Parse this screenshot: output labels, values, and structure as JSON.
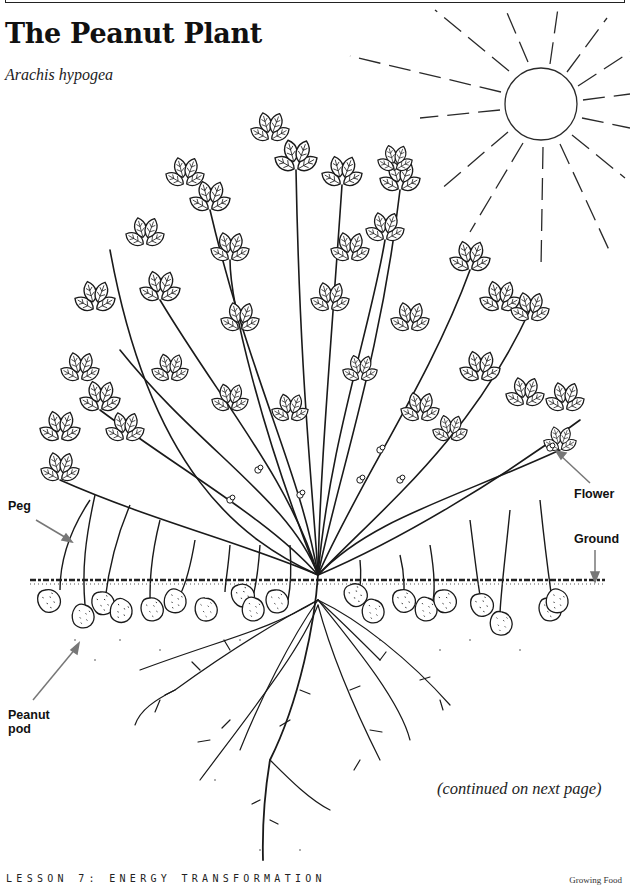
{
  "header": {
    "title": "The Peanut Plant",
    "subtitle": "Arachis hypogea"
  },
  "illustration": {
    "subject": "peanut-plant-line-drawing",
    "labels": {
      "peg": "Peg",
      "flower": "Flower",
      "ground": "Ground",
      "peanut_pod_line1": "Peanut",
      "peanut_pod_line2": "pod"
    },
    "elements": [
      "sun-icon",
      "leaves",
      "stems",
      "flowers",
      "pegs",
      "ground-line",
      "peanut-pods",
      "roots"
    ],
    "arrow_color": "#777777",
    "line_color": "#1a1a1a"
  },
  "continued_note": "(continued on next page)",
  "footer": {
    "lesson": "LESSON 7: ENERGY TRANSFORMATION",
    "book": "Growing Food"
  }
}
